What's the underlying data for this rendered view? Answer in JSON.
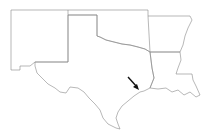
{
  "map": {
    "title": "",
    "regions": [
      "New Mexico",
      "Texas",
      "Oklahoma",
      "Arkansas",
      "Louisiana"
    ],
    "annotation": {
      "type": "arrow",
      "target": "Texas Gulf coast near Galveston Bay"
    },
    "colors": {
      "background": "#ffffff",
      "border": "#777777",
      "arrow": "#111111"
    }
  }
}
